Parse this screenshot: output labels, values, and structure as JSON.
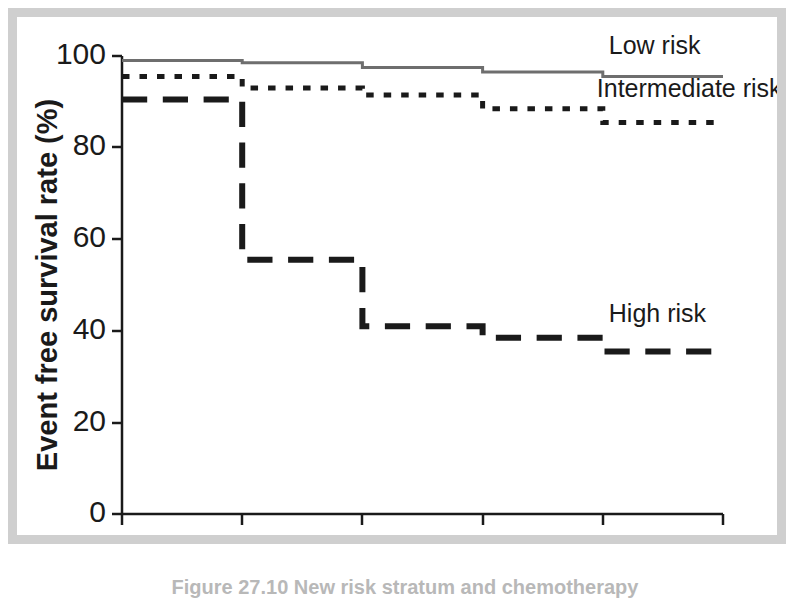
{
  "figure": {
    "frame_color": "#cfcfcf",
    "background_color": "#ffffff",
    "caption": "Figure 27.10  New risk stratum and chemotherapy"
  },
  "chart_data": {
    "type": "line",
    "subtype": "kaplan-meier-step",
    "title": "",
    "xlabel": "Years",
    "ylabel": "Event free survival rate (%)",
    "xlim": [
      0,
      5
    ],
    "ylim": [
      0,
      100
    ],
    "xticks": [
      "0",
      "1",
      "2",
      "3",
      "4",
      "5"
    ],
    "yticks": [
      "0",
      "20",
      "40",
      "60",
      "80",
      "100"
    ],
    "grid": false,
    "legend_position": "inline-right",
    "x": [
      0,
      1,
      2,
      3,
      4,
      5
    ],
    "series": [
      {
        "name": "Low risk",
        "label": "Low risk",
        "values": [
          99.0,
          98.5,
          97.5,
          96.5,
          95.5,
          95.5
        ],
        "style": "solid",
        "color": "#6e6e6e",
        "width": 3
      },
      {
        "name": "Intermediate risk",
        "label": "Intermediate risk",
        "values": [
          95.5,
          93.0,
          91.5,
          88.5,
          85.5,
          85.5
        ],
        "style": "dotted",
        "color": "#1a1a1a",
        "width": 5
      },
      {
        "name": "High risk",
        "label": "High risk",
        "values": [
          90.5,
          55.5,
          41.0,
          38.5,
          35.5,
          35.5
        ],
        "style": "dashed",
        "color": "#1a1a1a",
        "width": 6
      }
    ],
    "annotations": [
      {
        "text": "Low risk",
        "x": 4.05,
        "y": 100.5
      },
      {
        "text": "Intermediate risk",
        "x": 3.95,
        "y": 91.0
      },
      {
        "text": "High risk",
        "x": 4.05,
        "y": 42.0
      }
    ]
  },
  "axes": {
    "x_tick_values": [
      0,
      1,
      2,
      3,
      4,
      5
    ],
    "y_tick_values": [
      0,
      20,
      40,
      60,
      80,
      100
    ],
    "axis_color": "#1a1a1a"
  }
}
